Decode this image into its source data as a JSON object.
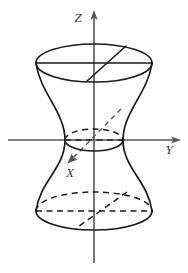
{
  "figure": {
    "background_color": "#ffffff",
    "outline_color": "#1a1a1a",
    "axis_color": "#565656",
    "label_color": "#3a3a3a"
  },
  "axes": {
    "z": {
      "label": "Z",
      "style": "solid-with-arrow",
      "direction": "up",
      "arrow_tip": {
        "x": 94,
        "y": 11
      },
      "tail": {
        "x": 94,
        "y": 263
      },
      "label_position": {
        "x": 78,
        "y": 22
      }
    },
    "y": {
      "label": "Y",
      "style": "solid-with-arrow",
      "direction": "right",
      "arrow_tip": {
        "x": 180,
        "y": 140
      },
      "tail": {
        "x": 8,
        "y": 140
      },
      "label_position": {
        "x": 169,
        "y": 153
      }
    },
    "x": {
      "label": "X",
      "style": "dashed-with-arrow",
      "direction": "down-left",
      "arrow_tip": {
        "x": 68,
        "y": 163
      },
      "tail": {
        "x": 120,
        "y": 110
      },
      "label_position": {
        "x": 70,
        "y": 176
      }
    }
  },
  "origin": {
    "x": 94,
    "y": 140
  },
  "surface": {
    "name": "hyperboloid-of-one-sheet",
    "top_ellipse": {
      "cx": 94,
      "cy": 63,
      "rx": 58,
      "ry": 19,
      "upper_half": "solid",
      "lower_half": "solid"
    },
    "throat_ellipse": {
      "cx": 94,
      "cy": 140,
      "rx": 29,
      "ry": 11,
      "upper_half": "dashed",
      "lower_half": "solid"
    },
    "bottom_ellipse": {
      "cx": 94,
      "cy": 211,
      "rx": 58,
      "ry": 19,
      "upper_half": "dashed",
      "lower_half": "solid"
    },
    "left_silhouette": {
      "top": {
        "x": 36,
        "y": 63
      },
      "throat": {
        "x": 65,
        "y": 140
      },
      "bottom": {
        "x": 36,
        "y": 211
      }
    },
    "right_silhouette": {
      "top": {
        "x": 152,
        "y": 63
      },
      "throat": {
        "x": 123,
        "y": 140
      },
      "bottom": {
        "x": 152,
        "y": 211
      }
    },
    "top_diameter_chord": "solid-horizontal",
    "top_generator_chord": "solid-diagonal",
    "bottom_diameter_chord": "dashed-horizontal",
    "bottom_generator_chord": "dashed-diagonal"
  }
}
